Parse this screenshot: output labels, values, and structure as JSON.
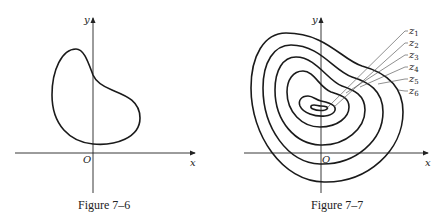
{
  "figures": [
    {
      "caption": "Figure 7–6",
      "axes": {
        "x_label": "x",
        "y_label": "y",
        "origin_label": "O"
      },
      "curves": 1
    },
    {
      "caption": "Figure 7–7",
      "axes": {
        "x_label": "x",
        "y_label": "y",
        "origin_label": "O"
      },
      "level_labels": [
        {
          "base": "z",
          "sub": "1"
        },
        {
          "base": "z",
          "sub": "2"
        },
        {
          "base": "z",
          "sub": "3"
        },
        {
          "base": "z",
          "sub": "4"
        },
        {
          "base": "z",
          "sub": "5"
        },
        {
          "base": "z",
          "sub": "6"
        }
      ]
    }
  ]
}
